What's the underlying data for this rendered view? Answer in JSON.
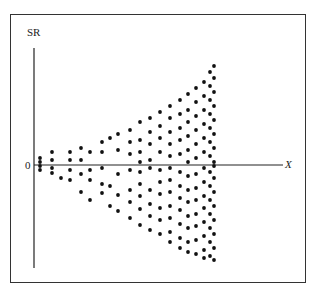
{
  "chart_data": {
    "type": "scatter",
    "title": "",
    "xlabel": "X",
    "ylabel": "SR",
    "origin_label": "0",
    "grid": false,
    "legend": null,
    "xlim": [
      0,
      250
    ],
    "ylim": [
      -103,
      117
    ],
    "pattern": "funnel (heteroscedastic residuals widening as X increases)",
    "points": [
      [
        6,
        7
      ],
      [
        6,
        3
      ],
      [
        6,
        -1
      ],
      [
        6,
        -5
      ],
      [
        18,
        13
      ],
      [
        18,
        5
      ],
      [
        18,
        -3
      ],
      [
        18,
        -8
      ],
      [
        27,
        -13
      ],
      [
        36,
        13
      ],
      [
        36,
        5
      ],
      [
        36,
        -5
      ],
      [
        36,
        -15
      ],
      [
        47,
        17
      ],
      [
        47,
        5
      ],
      [
        47,
        -9
      ],
      [
        47,
        -27
      ],
      [
        56,
        13
      ],
      [
        56,
        -5
      ],
      [
        56,
        -15
      ],
      [
        56,
        -35
      ],
      [
        68,
        23
      ],
      [
        68,
        13
      ],
      [
        68,
        -3
      ],
      [
        68,
        -19
      ],
      [
        68,
        -28
      ],
      [
        76,
        27
      ],
      [
        76,
        -21
      ],
      [
        76,
        -41
      ],
      [
        84,
        31
      ],
      [
        84,
        15
      ],
      [
        84,
        -9
      ],
      [
        84,
        -30
      ],
      [
        84,
        -46
      ],
      [
        96,
        35
      ],
      [
        96,
        23
      ],
      [
        96,
        11
      ],
      [
        96,
        -5
      ],
      [
        96,
        -25
      ],
      [
        96,
        -37
      ],
      [
        96,
        -53
      ],
      [
        106,
        43
      ],
      [
        106,
        25
      ],
      [
        106,
        13
      ],
      [
        106,
        3
      ],
      [
        106,
        -7
      ],
      [
        106,
        -19
      ],
      [
        106,
        -31
      ],
      [
        106,
        -44
      ],
      [
        106,
        -60
      ],
      [
        116,
        47
      ],
      [
        116,
        33
      ],
      [
        116,
        21
      ],
      [
        116,
        5
      ],
      [
        116,
        -3
      ],
      [
        116,
        -25
      ],
      [
        116,
        -39
      ],
      [
        116,
        -51
      ],
      [
        116,
        -65
      ],
      [
        126,
        53
      ],
      [
        126,
        39
      ],
      [
        126,
        27
      ],
      [
        126,
        13
      ],
      [
        126,
        -5
      ],
      [
        126,
        -17
      ],
      [
        126,
        -29
      ],
      [
        126,
        -43
      ],
      [
        126,
        -55
      ],
      [
        126,
        -69
      ],
      [
        136,
        59
      ],
      [
        136,
        47
      ],
      [
        136,
        33
      ],
      [
        136,
        21
      ],
      [
        136,
        9
      ],
      [
        136,
        -3
      ],
      [
        136,
        -15
      ],
      [
        136,
        -27
      ],
      [
        136,
        -41
      ],
      [
        136,
        -53
      ],
      [
        136,
        -67
      ],
      [
        136,
        -77
      ],
      [
        146,
        65
      ],
      [
        146,
        51
      ],
      [
        146,
        37
      ],
      [
        146,
        25
      ],
      [
        146,
        11
      ],
      [
        146,
        -7
      ],
      [
        146,
        -21
      ],
      [
        146,
        -33
      ],
      [
        146,
        -45
      ],
      [
        146,
        -59
      ],
      [
        146,
        -73
      ],
      [
        146,
        -83
      ],
      [
        154,
        71
      ],
      [
        154,
        55
      ],
      [
        154,
        43
      ],
      [
        154,
        29
      ],
      [
        154,
        15
      ],
      [
        154,
        3
      ],
      [
        154,
        -11
      ],
      [
        154,
        -25
      ],
      [
        154,
        -37
      ],
      [
        154,
        -51
      ],
      [
        154,
        -63
      ],
      [
        154,
        -77
      ],
      [
        154,
        -87
      ],
      [
        162,
        77
      ],
      [
        162,
        63
      ],
      [
        162,
        49
      ],
      [
        162,
        35
      ],
      [
        162,
        21
      ],
      [
        162,
        7
      ],
      [
        162,
        -9
      ],
      [
        162,
        -23
      ],
      [
        162,
        -35
      ],
      [
        162,
        -49
      ],
      [
        162,
        -61
      ],
      [
        162,
        -75
      ],
      [
        162,
        -89
      ],
      [
        170,
        83
      ],
      [
        170,
        69
      ],
      [
        170,
        55
      ],
      [
        170,
        41
      ],
      [
        170,
        27
      ],
      [
        170,
        13
      ],
      [
        170,
        -3
      ],
      [
        170,
        -17
      ],
      [
        170,
        -31
      ],
      [
        170,
        -43
      ],
      [
        170,
        -57
      ],
      [
        170,
        -71
      ],
      [
        170,
        -85
      ],
      [
        170,
        -93
      ],
      [
        176,
        93
      ],
      [
        176,
        79
      ],
      [
        176,
        65
      ],
      [
        176,
        51
      ],
      [
        176,
        37
      ],
      [
        176,
        23
      ],
      [
        176,
        9
      ],
      [
        176,
        -7
      ],
      [
        176,
        -21
      ],
      [
        176,
        -35
      ],
      [
        176,
        -49
      ],
      [
        176,
        -63
      ],
      [
        176,
        -77
      ],
      [
        176,
        -91
      ],
      [
        180,
        99
      ],
      [
        180,
        87
      ],
      [
        180,
        73
      ],
      [
        180,
        59
      ],
      [
        180,
        45
      ],
      [
        180,
        31
      ],
      [
        180,
        17
      ],
      [
        180,
        3
      ],
      [
        180,
        -1
      ],
      [
        180,
        -13
      ],
      [
        180,
        -27
      ],
      [
        180,
        -41
      ],
      [
        180,
        -55
      ],
      [
        180,
        -69
      ],
      [
        180,
        -83
      ],
      [
        180,
        -95
      ]
    ]
  },
  "axes": {
    "origin_px": [
      34,
      165
    ],
    "y_axis_top_px": 48,
    "y_axis_bottom_px": 268,
    "x_axis_right_px": 283
  },
  "colors": {
    "ink": "#111111",
    "frame": "#333333",
    "background": "#ffffff"
  }
}
